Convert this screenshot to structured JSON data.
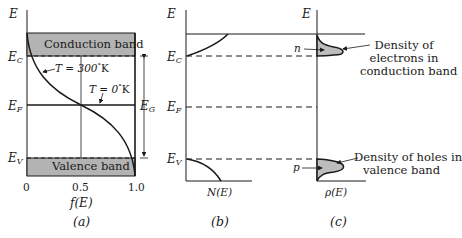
{
  "figure": {
    "panels": [
      {
        "id": "a",
        "caption": "(a)",
        "y_axis_label": "E",
        "x_axis_label": "f(E)",
        "x_ticks": [
          "0",
          "0.5",
          "1.0"
        ],
        "energy_levels": {
          "Ec": "E",
          "Ec_sub": "C",
          "Ef": "E",
          "Ef_sub": "F",
          "Ev": "E",
          "Ev_sub": "V"
        },
        "conduction_band_label": "Conduction band",
        "valence_band_label": "Valence band",
        "curve_300K_label": "T = 300",
        "curve_300K_unit": "K",
        "curve_0K_label": "T = 0",
        "curve_0K_unit": "K",
        "degree": "°",
        "gap_label": "E",
        "gap_label_sub": "G"
      },
      {
        "id": "b",
        "caption": "(b)",
        "y_axis_label": "E",
        "x_axis_label": "N(E)",
        "energy_levels": {
          "Ec": "E",
          "Ec_sub": "C",
          "Ef": "E",
          "Ef_sub": "F",
          "Ev": "E",
          "Ev_sub": "V"
        }
      },
      {
        "id": "c",
        "caption": "(c)",
        "y_axis_label": "E",
        "x_axis_label": "ρ(E)",
        "electron_symbol": "n",
        "hole_symbol": "p",
        "electron_note": [
          "Density of",
          "electrons in",
          "conduction band"
        ],
        "hole_note": [
          "Density of holes in",
          "valence band"
        ]
      }
    ],
    "colors": {
      "band_fill": "#b3b3b3",
      "line": "#1a1a1a",
      "peak_fill": "#bdbdbd"
    }
  }
}
